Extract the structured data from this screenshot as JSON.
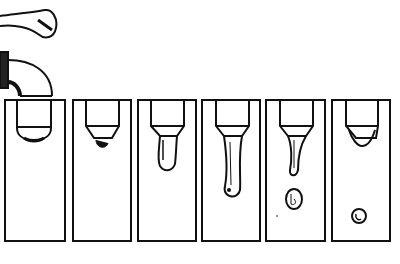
{
  "figure": {
    "panel_count": 6,
    "colors": {
      "ink": "#111111",
      "background": "#ffffff"
    },
    "panels": [
      {
        "stage": 1,
        "description": "faucet spout over tube, drop barely forming"
      },
      {
        "stage": 2,
        "description": "small drop hanging at tip"
      },
      {
        "stage": 3,
        "description": "drop elongating"
      },
      {
        "stage": 4,
        "description": "long neck with bulb, about to detach"
      },
      {
        "stage": 5,
        "description": "drop detached, falling; residual neck"
      },
      {
        "stage": 6,
        "description": "spherical drop falling, new drop starting"
      }
    ]
  }
}
